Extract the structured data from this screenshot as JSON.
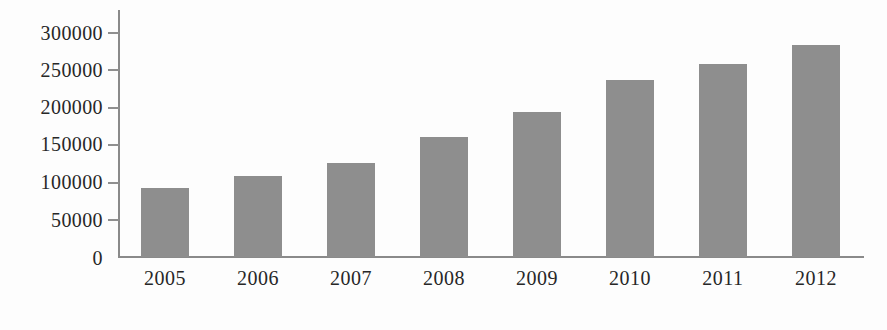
{
  "chart_data": {
    "type": "bar",
    "title": "",
    "subtitle": "",
    "xlabel": "",
    "ylabel": "",
    "categories": [
      "2005",
      "2006",
      "2007",
      "2008",
      "2009",
      "2010",
      "2011",
      "2012"
    ],
    "values": [
      92000,
      108000,
      126000,
      161000,
      194000,
      237000,
      258000,
      284000
    ],
    "series": [
      {
        "name": "",
        "values": [
          92000,
          108000,
          126000,
          161000,
          194000,
          237000,
          258000,
          284000
        ]
      }
    ],
    "ylim": [
      0,
      300000
    ],
    "ytick_labels": [
      "0",
      "50000",
      "100000",
      "150000",
      "200000",
      "250000",
      "300000"
    ],
    "ytick_values": [
      0,
      50000,
      100000,
      150000,
      200000,
      250000,
      300000
    ],
    "grid": false,
    "legend": null,
    "legend_position": "none",
    "annotations": [],
    "bar_color": "#8e8e8e",
    "axis_color": "#8a8a8a",
    "text_color": "#272727",
    "background_color": "#fdfdfd"
  }
}
